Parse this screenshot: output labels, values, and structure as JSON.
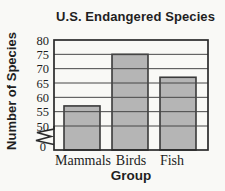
{
  "chart_data": {
    "type": "bar",
    "title": "U.S. Endangered Species",
    "xlabel": "Group",
    "ylabel": "Number of Species",
    "categories": [
      "Mammals",
      "Birds",
      "Fish"
    ],
    "values": [
      57,
      75,
      67
    ],
    "yticks": [
      0,
      50,
      55,
      60,
      65,
      70,
      75,
      80
    ],
    "ylim": [
      50,
      80
    ],
    "axis_break_between": [
      0,
      50
    ],
    "grid": true,
    "gridlines_over_bars": true,
    "legend": "none",
    "bar_fill_color": "#b5b5b5",
    "bar_border_color": "#3a3a3a",
    "line_color": "#2b2b2b",
    "text_color": "#1d1d1d",
    "background_color": "#f9f9f6"
  }
}
